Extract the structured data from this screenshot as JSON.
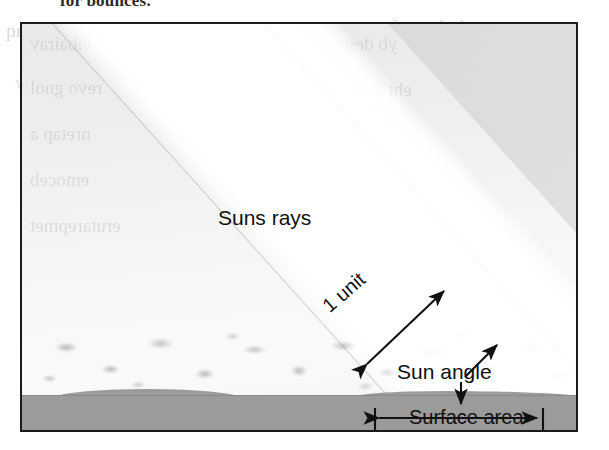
{
  "page": {
    "top_cut_text": "for bounces.",
    "bleed_left_lines": "snoitseuq\nrewsna\nlliw uoy\nretpahc\nsiht nI",
    "bleed_right_lines": "yb demrof\nsyar nus\neht fo\nelgna eht\nyb desuac",
    "bleed_bottom_left": "sdnab\ndetaerc",
    "bleed_bottom_right": "snoitseuQ weiveR"
  },
  "figure": {
    "name": "sun-angle-surface-area-diagram",
    "labels": {
      "suns_rays": "Suns rays",
      "one_unit": "1 unit",
      "sun_angle": "Sun angle",
      "surface_area": "Surface area"
    },
    "colors": {
      "frame": "#1b1b1b",
      "sky": "#f2f2f2",
      "beam": "#ffffff",
      "ground": "#9b9b9b",
      "annotation": "#111111"
    }
  },
  "annotations": {
    "one_unit_arrow": "double-headed-diagonal-arrow",
    "sun_angle_arrow_up": "arrow-up-right",
    "sun_angle_arrow_down": "arrow-down",
    "surface_area_arrow": "double-headed-horizontal-arrow-with-end-ticks"
  }
}
